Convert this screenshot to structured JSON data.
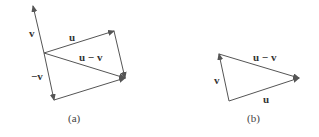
{
  "figure_a": {
    "caption": "(a)",
    "labels": {
      "v": "v",
      "neg_v": "−v",
      "u": "u",
      "u_minus_v": "u − v"
    }
  },
  "figure_b": {
    "caption": "(b)",
    "labels": {
      "v": "v",
      "u": "u",
      "u_minus_v": "u − v"
    }
  },
  "colors": {
    "stroke": "#555555",
    "text": "#333333"
  }
}
